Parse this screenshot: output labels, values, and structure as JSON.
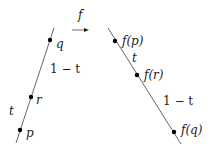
{
  "arrow_label": "f",
  "left": {
    "points": [
      {
        "label": "q"
      },
      {
        "label": "r"
      },
      {
        "label": "p"
      }
    ],
    "segment_labels": [
      "1 − t",
      "t"
    ]
  },
  "right": {
    "points": [
      {
        "label": "f(p)"
      },
      {
        "label": "f(r)"
      },
      {
        "label": "f(q)"
      }
    ],
    "segment_labels": [
      "t",
      "1 − t"
    ]
  },
  "colors": {
    "line": "#444444",
    "point": "#000000",
    "text": "#222222"
  }
}
